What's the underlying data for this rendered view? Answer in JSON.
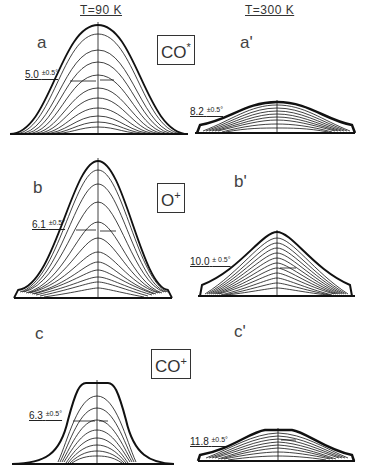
{
  "columns": {
    "left": {
      "temperature_label": "T=90 K"
    },
    "right": {
      "temperature_label": "T=300 K"
    }
  },
  "rows": [
    {
      "species": {
        "base": "CO",
        "superscript": "*"
      },
      "left": {
        "panel_label": "a",
        "fwhm_value": "5.0",
        "fwhm_error": "±0.5°"
      },
      "right": {
        "panel_label": "a'",
        "fwhm_value": "8.2",
        "fwhm_error": "±0.5°"
      }
    },
    {
      "species": {
        "base": "O",
        "superscript": "+"
      },
      "left": {
        "panel_label": "b",
        "fwhm_value": "6.1",
        "fwhm_error": "±0.5°"
      },
      "right": {
        "panel_label": "b'",
        "fwhm_value": "10.0",
        "fwhm_error": "± 0.5°"
      }
    },
    {
      "species": {
        "base": "CO",
        "superscript": "+"
      },
      "left": {
        "panel_label": "c",
        "fwhm_value": "6.3",
        "fwhm_error": "±0.5°"
      },
      "right": {
        "panel_label": "c'",
        "fwhm_value": "11.8",
        "fwhm_error": "±0.5°"
      }
    }
  ],
  "colors": {
    "ink": "#111111",
    "background": "#ffffff"
  }
}
